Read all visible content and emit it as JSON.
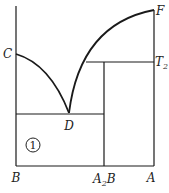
{
  "diagram": {
    "type": "binary phase diagram",
    "labels": {
      "C": "C",
      "F": "F",
      "T2_main": "T",
      "T2_sub": "2",
      "D": "D",
      "B": "B",
      "A2B_A": "A",
      "A2B_sub": "2",
      "A2B_B": "B",
      "A": "A",
      "region1": "1"
    },
    "x_axis_components": [
      "B",
      "A2B",
      "A"
    ],
    "points": [
      "C",
      "D",
      "F",
      "T2"
    ],
    "regions": [
      "1"
    ],
    "line_color": "#1a1a1a"
  }
}
